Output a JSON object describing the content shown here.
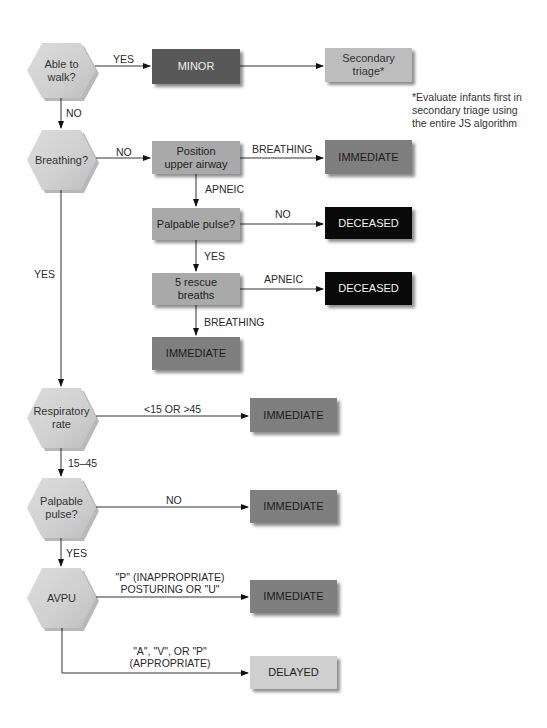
{
  "diagram": {
    "type": "triage-flowchart",
    "colors": {
      "minor": "#585858",
      "secondary": "#bdbdbd",
      "immediate": "#7f7f7f",
      "process": "#a9a9a9",
      "deceased": "#0a0a0a",
      "delayed": "#cfcfcf",
      "decision": "#d4d4d4"
    },
    "decisions": {
      "able_to_walk": "Able to walk?",
      "breathing": "Breathing?",
      "respiratory_rate": "Respiratory rate",
      "palpable_pulse": "Palpable pulse?",
      "avpu": "AVPU"
    },
    "processes": {
      "position_airway": "Position upper airway",
      "palpable_pulse": "Palpable pulse?",
      "rescue_breaths": "5 rescue breaths"
    },
    "outcomes": {
      "minor": "MINOR",
      "secondary_triage": "Secondary triage*",
      "immediate_breathing": "IMMEDIATE",
      "deceased_no_pulse": "DECEASED",
      "deceased_apneic": "DECEASED",
      "immediate_rescue": "IMMEDIATE",
      "immediate_resp": "IMMEDIATE",
      "immediate_pulse": "IMMEDIATE",
      "immediate_avpu": "IMMEDIATE",
      "delayed": "DELAYED"
    },
    "edge_labels": {
      "walk_yes": "YES",
      "walk_no": "NO",
      "breathing_no": "NO",
      "breathing_yes": "YES",
      "airway_breathing": "BREATHING",
      "airway_apneic": "APNEIC",
      "pulse_no": "NO",
      "pulse_yes": "YES",
      "rescue_apneic": "APNEIC",
      "rescue_breathing": "BREATHING",
      "resp_out_of_range": "<15 OR >45",
      "resp_in_range": "15–45",
      "palpable_no": "NO",
      "palpable_yes": "YES",
      "avpu_immediate_line1": "\"P\" (INAPPROPRIATE)",
      "avpu_immediate_line2": "POSTURING OR \"U\"",
      "avpu_delayed_line1": "\"A\", \"V\", OR \"P\"",
      "avpu_delayed_line2": "(APPROPRIATE)"
    },
    "footnote": {
      "line1": "*Evaluate infants first in",
      "line2": "secondary triage using",
      "line3": "the entire JS algorithm"
    }
  }
}
